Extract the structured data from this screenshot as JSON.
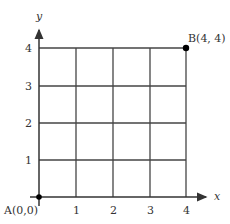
{
  "diagram": {
    "type": "coordinate-grid",
    "grid": {
      "x_min": 0,
      "x_max": 4,
      "y_min": 0,
      "y_max": 4,
      "step": 1
    },
    "axes": {
      "x_label": "x",
      "y_label": "y"
    },
    "x_ticks": [
      "1",
      "2",
      "3",
      "4"
    ],
    "y_ticks": [
      "1",
      "2",
      "3",
      "4"
    ],
    "points": [
      {
        "name": "A",
        "label": "A(0,0)",
        "x": 0,
        "y": 0
      },
      {
        "name": "B",
        "label": "B(4, 4)",
        "x": 4,
        "y": 4
      }
    ],
    "colors": {
      "line": "#333333",
      "point": "#000000"
    }
  }
}
